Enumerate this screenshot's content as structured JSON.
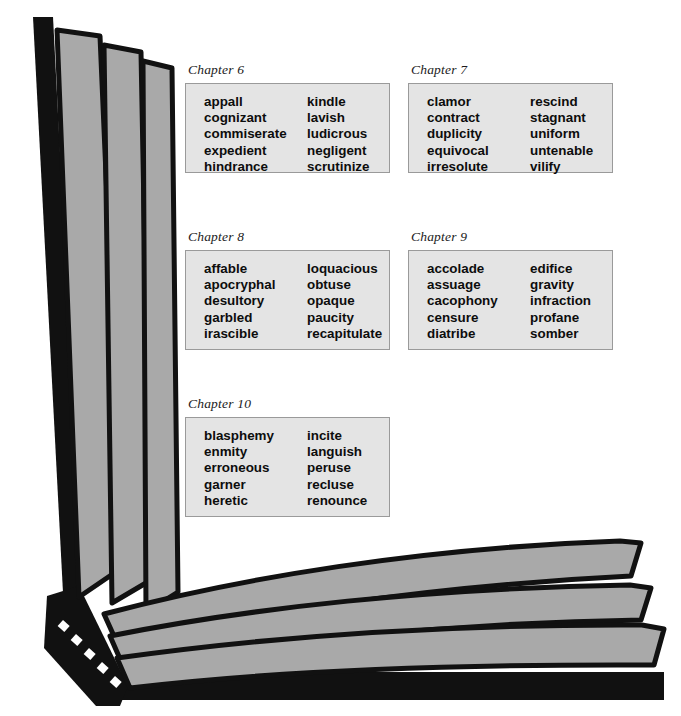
{
  "illustration": {
    "name": "open-book-illustration",
    "colors": {
      "cover": "#111111",
      "page_fill": "#a9a9a9",
      "page_outline": "#111111",
      "background": "#ffffff"
    }
  },
  "styles": {
    "box_fill": "#e4e4e4",
    "box_border": "#9a9a9a",
    "text_color": "#0d0d0d"
  },
  "chapters": [
    {
      "label": "Chapter 6",
      "left_words": [
        "appall",
        "cognizant",
        "commiserate",
        "expedient",
        "hindrance"
      ],
      "right_words": [
        "kindle",
        "lavish",
        "ludicrous",
        "negligent",
        "scrutinize"
      ]
    },
    {
      "label": "Chapter 7",
      "left_words": [
        "clamor",
        "contract",
        "duplicity",
        "equivocal",
        "irresolute"
      ],
      "right_words": [
        "rescind",
        "stagnant",
        "uniform",
        "untenable",
        "vilify"
      ]
    },
    {
      "label": "Chapter 8",
      "left_words": [
        "affable",
        "apocryphal",
        "desultory",
        "garbled",
        "irascible"
      ],
      "right_words": [
        "loquacious",
        "obtuse",
        "opaque",
        "paucity",
        "recapitulate"
      ]
    },
    {
      "label": "Chapter 9",
      "left_words": [
        "accolade",
        "assuage",
        "cacophony",
        "censure",
        "diatribe"
      ],
      "right_words": [
        "edifice",
        "gravity",
        "infraction",
        "profane",
        "somber"
      ]
    },
    {
      "label": "Chapter 10",
      "left_words": [
        "blasphemy",
        "enmity",
        "erroneous",
        "garner",
        "heretic"
      ],
      "right_words": [
        "incite",
        "languish",
        "peruse",
        "recluse",
        "renounce"
      ]
    }
  ]
}
